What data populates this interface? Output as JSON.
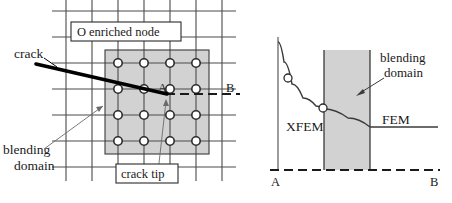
{
  "figure": {
    "panels": [
      "mesh-panel",
      "profile-panel"
    ]
  },
  "colors": {
    "grid_line": "#4a4a4a",
    "mesh_outline": "#222222",
    "shaded_domain": "#d2d2d2",
    "shaded_domain_border": "#3a3a3a",
    "crack_line": "#000000",
    "dashed_line": "#1a1a1a",
    "curve": "#3a3a3a",
    "node_ring": "#2b2b2b",
    "text": "#1a1a1a",
    "leader_line": "#6b6b6b",
    "background": "#ffffff"
  },
  "mesh_panel": {
    "legend_enriched": {
      "marker": "O",
      "label": "enriched node"
    },
    "crack_label": "crack",
    "blending_label_line1": "blending",
    "blending_label_line2": "domain",
    "crack_tip_label": "crack tip",
    "section_start_label": "A",
    "section_end_label": "B",
    "grid": {
      "columns": 7,
      "rows": 7,
      "x_lines": [
        66,
        92,
        118,
        144,
        170,
        196,
        222
      ],
      "y_lines": [
        11,
        37,
        63,
        89,
        115,
        141,
        167
      ],
      "left": 66,
      "right": 222,
      "top": 11,
      "bottom": 167,
      "extend": 14
    },
    "enrichment_zone": {
      "x0": 105,
      "x1": 209,
      "y0": 50,
      "y1": 154
    },
    "enriched_nodes": [
      {
        "x": 118,
        "y": 63
      },
      {
        "x": 144,
        "y": 63
      },
      {
        "x": 170,
        "y": 63
      },
      {
        "x": 196,
        "y": 63
      },
      {
        "x": 118,
        "y": 89
      },
      {
        "x": 144,
        "y": 89
      },
      {
        "x": 170,
        "y": 89
      },
      {
        "x": 196,
        "y": 89
      },
      {
        "x": 118,
        "y": 115
      },
      {
        "x": 144,
        "y": 115
      },
      {
        "x": 170,
        "y": 115
      },
      {
        "x": 196,
        "y": 115
      },
      {
        "x": 118,
        "y": 141
      },
      {
        "x": 144,
        "y": 141
      },
      {
        "x": 170,
        "y": 141
      },
      {
        "x": 196,
        "y": 141
      }
    ],
    "node_radius": 4.2,
    "crack": {
      "x1": 36,
      "y1": 64,
      "x2": 166,
      "y2": 94,
      "tip_x": 166,
      "tip_y": 94
    },
    "section_line": {
      "x1": 166,
      "y1": 94,
      "x2": 240,
      "y2": 94
    }
  },
  "profile_panel": {
    "xfem_label": "XFEM",
    "fem_label": "FEM",
    "blending_label_line1": "blending",
    "blending_label_line2": "domain",
    "axis_start_label": "A",
    "axis_end_label": "B",
    "axis": {
      "vertical_x": 278,
      "vertical_top": 37,
      "vertical_bottom": 170,
      "baseline_y": 170,
      "baseline_x0": 270,
      "baseline_x1": 440
    },
    "blending_band": {
      "x0": 324,
      "x1": 370,
      "y_top": 50,
      "y_bottom": 170
    },
    "curve_points": [
      {
        "x": 278,
        "y": 42
      },
      {
        "x": 284,
        "y": 62
      },
      {
        "x": 292,
        "y": 84
      },
      {
        "x": 303,
        "y": 98
      },
      {
        "x": 316,
        "y": 106
      },
      {
        "x": 324,
        "y": 109
      },
      {
        "x": 348,
        "y": 118
      },
      {
        "x": 370,
        "y": 127
      }
    ],
    "fem_segment": {
      "x0": 370,
      "y0": 127,
      "x1": 438,
      "y1": 127
    },
    "markers": [
      {
        "x": 288,
        "y": 78
      },
      {
        "x": 323,
        "y": 108
      }
    ],
    "marker_radius": 4.0,
    "blending_arrow": {
      "x1": 383,
      "y1": 79,
      "x2": 358,
      "y2": 95
    }
  }
}
